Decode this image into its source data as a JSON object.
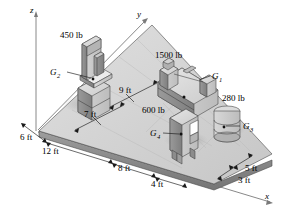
{
  "figure": {
    "background": "#ffffff",
    "axes": [
      {
        "name": "z-axis",
        "label": "z"
      },
      {
        "name": "y-axis",
        "label": "y"
      },
      {
        "name": "x-axis",
        "label": "x"
      }
    ]
  },
  "weights": {
    "g1": "1500 lb",
    "g2": "450 lb",
    "g3": "280 lb",
    "g4": "600 lb"
  },
  "cg_labels": {
    "g1": "G",
    "g1_sub": "1",
    "g2": "G",
    "g2_sub": "2",
    "g3": "G",
    "g3_sub": "3",
    "g4": "G",
    "g4_sub": "4"
  },
  "dimensions": [
    {
      "name": "dim-6ft",
      "label": "6 ft"
    },
    {
      "name": "dim-12ft",
      "label": "12 ft"
    },
    {
      "name": "dim-7ft",
      "label": "7 ft"
    },
    {
      "name": "dim-9ft",
      "label": "9 ft"
    },
    {
      "name": "dim-8ft",
      "label": "8 ft"
    },
    {
      "name": "dim-4ft",
      "label": "4 ft"
    },
    {
      "name": "dim-5ft",
      "label": "5 ft"
    },
    {
      "name": "dim-3ft",
      "label": "3 ft"
    }
  ],
  "colors": {
    "floor_top": "#d4d4d4",
    "floor_edge": "#8e8e8e",
    "machine_light": "#cfcfcf",
    "machine_mid": "#a8a8a8",
    "machine_dark": "#7d7d7d",
    "outline": "#4a4a4a",
    "axis": "#7a7a7a",
    "text": "#000000"
  }
}
